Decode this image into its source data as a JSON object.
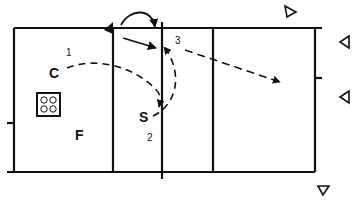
{
  "diagram": {
    "type": "volleyball-drill",
    "colors": {
      "ink": "#111111",
      "background": "#ffffff"
    },
    "players": [
      {
        "id": "coach",
        "label": "C",
        "order": "1"
      },
      {
        "id": "setter",
        "label": "S",
        "order": "2"
      },
      {
        "id": "feeder",
        "label": "F",
        "order": ""
      }
    ],
    "markers": {
      "step3": "3"
    },
    "equipment": [
      {
        "id": "ball-cart",
        "balls": 4
      }
    ],
    "targets": [
      {
        "id": "target-1",
        "direction": "right"
      },
      {
        "id": "target-2",
        "direction": "left"
      },
      {
        "id": "target-3",
        "direction": "left"
      },
      {
        "id": "target-4",
        "direction": "down"
      }
    ]
  }
}
